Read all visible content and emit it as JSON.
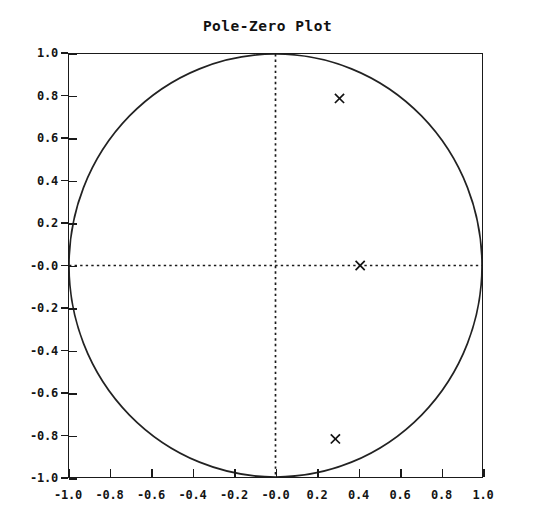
{
  "chart_data": {
    "type": "scatter",
    "title": "Pole-Zero Plot",
    "xlabel": "",
    "ylabel": "",
    "xlim": [
      -1.0,
      1.0
    ],
    "ylim": [
      -1.0,
      1.0
    ],
    "grid": false,
    "legend": null,
    "xticks": [
      "-1.0",
      "-0.8",
      "-0.6",
      "-0.4",
      "-0.2",
      "-0.0",
      "0.2",
      "0.4",
      "0.6",
      "0.8",
      "1.0"
    ],
    "xtick_values": [
      -1.0,
      -0.8,
      -0.6,
      -0.4,
      -0.2,
      0.0,
      0.2,
      0.4,
      0.6,
      0.8,
      1.0
    ],
    "yticks": [
      "1.0",
      "0.8",
      "0.6",
      "0.4",
      "0.2",
      "-0.0",
      "-0.2",
      "-0.4",
      "-0.6",
      "-0.8",
      "-1.0"
    ],
    "ytick_values": [
      1.0,
      0.8,
      0.6,
      0.4,
      0.2,
      0.0,
      -0.2,
      -0.4,
      -0.6,
      -0.8,
      -1.0
    ],
    "annotations": {
      "unit_circle": {
        "center_x": 0.0,
        "center_y": 0.0,
        "radius": 1.0,
        "style": "solid"
      },
      "real_axis_line": {
        "y": 0.0,
        "style": "dotted"
      },
      "imag_axis_line": {
        "x": 0.0,
        "style": "dotted"
      }
    },
    "series": [
      {
        "name": "poles",
        "marker": "x",
        "points": [
          {
            "x": 0.31,
            "y": 0.79
          },
          {
            "x": 0.29,
            "y": -0.82
          },
          {
            "x": 0.41,
            "y": 0.0
          }
        ]
      }
    ]
  },
  "colors": {
    "background": "#ffffff",
    "foreground": "#1a1a1a",
    "marker": "#111111",
    "circle": "#222222"
  }
}
